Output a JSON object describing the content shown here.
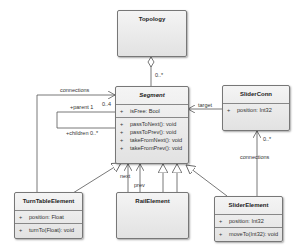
{
  "classes": {
    "topology": {
      "name": "Topology"
    },
    "segment": {
      "name": "Segment",
      "attributes": [
        {
          "vis": "+",
          "text": "isFree: Bool"
        }
      ],
      "operations": [
        {
          "vis": "+",
          "text": "passToNext(): void"
        },
        {
          "vis": "+",
          "text": "passToPrev(): void"
        },
        {
          "vis": "+",
          "text": "takeFromNext(): void"
        },
        {
          "vis": "+",
          "text": "takeFromPrev(): void"
        }
      ]
    },
    "sliderconn": {
      "name": "SliderConn",
      "attributes": [
        {
          "vis": "+",
          "text": "position: Int32"
        }
      ]
    },
    "turntable": {
      "name": "TurnTableElement",
      "attributes": [
        {
          "vis": "+",
          "text": "position: Float"
        }
      ],
      "operations": [
        {
          "vis": "+",
          "text": "turnTo(Float): void"
        }
      ]
    },
    "rail": {
      "name": "RailElement"
    },
    "slider": {
      "name": "SliderElement",
      "attributes": [
        {
          "vis": "+",
          "text": "position: Int32"
        }
      ],
      "operations": [
        {
          "vis": "+",
          "text": "moveTo(Int32): void"
        }
      ]
    }
  },
  "labels": {
    "topology_mult": "0..*",
    "connections_left": "connections",
    "segment_mult_04": "0..4",
    "parent": "+parent 1",
    "children": "+children 0..*",
    "target": "target",
    "sliderconn_mult": "0..*",
    "connections_right": "connections",
    "next": "next",
    "prev": "prev"
  }
}
